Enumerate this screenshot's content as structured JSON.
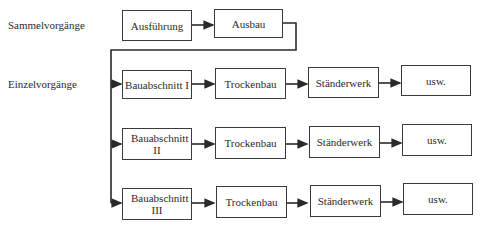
{
  "labels": {
    "sammel": "Sammelvorgänge",
    "einzel": "Einzelvorgänge"
  },
  "sammel_boxes": [
    "Ausführung",
    "Ausbau"
  ],
  "rows": [
    {
      "section": "Bauabschnitt I",
      "steps": [
        "Trockenbau",
        "Ständerwerk",
        "usw."
      ]
    },
    {
      "section": "Bauabschnitt II",
      "steps": [
        "Trockenbau",
        "Ständerwerk",
        "usw."
      ]
    },
    {
      "section": "Bauabschnitt III",
      "steps": [
        "Trockenbau",
        "Ständerwerk",
        "usw."
      ]
    }
  ],
  "colors": {
    "line": "#2a2a2a",
    "box_border": "#3a3a3a"
  }
}
